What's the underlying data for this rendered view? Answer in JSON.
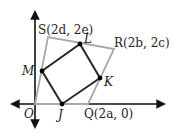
{
  "figure": {
    "colors": {
      "axes": "#111111",
      "outer_quadrilateral": "#a8a8a8",
      "inner_quadrilateral": "#2a2a2a",
      "points": "#000000",
      "labels": "#222222"
    },
    "axes": {
      "origin": {
        "x": 35,
        "y": 104
      },
      "x_left": 10,
      "x_right": 166,
      "y_top": 10,
      "y_bottom": 129
    },
    "outer_vertices": [
      {
        "id": "O",
        "label": "O",
        "x": 35,
        "y": 104
      },
      {
        "id": "Q",
        "label": "Q(2a, 0)",
        "x": 88,
        "y": 104
      },
      {
        "id": "R",
        "label": "R(2b, 2c)",
        "x": 114,
        "y": 49
      },
      {
        "id": "S",
        "label": "S(2d, 2e)",
        "x": 48,
        "y": 37
      }
    ],
    "inner_vertices": [
      {
        "id": "J",
        "label": "J",
        "x": 62,
        "y": 104
      },
      {
        "id": "K",
        "label": "K",
        "x": 100,
        "y": 78
      },
      {
        "id": "L",
        "label": "L",
        "x": 80,
        "y": 44
      },
      {
        "id": "M",
        "label": "M",
        "x": 42,
        "y": 71
      }
    ],
    "labels": {
      "S": "S(2d, 2e)",
      "R": "R(2b, 2c)",
      "Q": "Q(2a, 0)",
      "O": "O",
      "J": "J",
      "K": "K",
      "L": "L",
      "M": "M"
    }
  }
}
